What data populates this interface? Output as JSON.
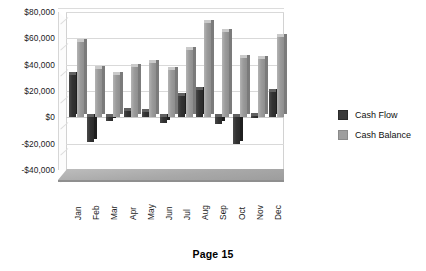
{
  "footer": {
    "page_label": "Page 15"
  },
  "legend": {
    "position": "right",
    "entries": [
      {
        "label": "Cash Flow",
        "color": "#3a3a3a"
      },
      {
        "label": "Cash Balance",
        "color": "#9e9e9e"
      }
    ]
  },
  "axes": {
    "y_ticks": [
      "$80,000",
      "$60,000",
      "$40,000",
      "$20,000",
      "$0",
      "-$20,000",
      "-$40,000"
    ],
    "y_tick_values": [
      80000,
      60000,
      40000,
      20000,
      0,
      -20000,
      -40000
    ],
    "x_ticks": [
      "Jan",
      "Feb",
      "Mar",
      "Apr",
      "May",
      "Jun",
      "Jul",
      "Aug",
      "Sep",
      "Oct",
      "Nov",
      "Dec"
    ]
  },
  "chart_data": {
    "type": "bar",
    "title": "",
    "subtitle": "",
    "xlabel": "",
    "ylabel": "",
    "ylim": [
      -40000,
      80000
    ],
    "ytick_step": 20000,
    "grid": true,
    "three_d": true,
    "legend_position": "right",
    "categories": [
      "Jan",
      "Feb",
      "Mar",
      "Apr",
      "May",
      "Jun",
      "Jul",
      "Aug",
      "Sep",
      "Oct",
      "Nov",
      "Dec"
    ],
    "series": [
      {
        "name": "Cash Flow",
        "color": "#3a3a3a",
        "values": [
          32000,
          -19000,
          -3000,
          5000,
          4000,
          -4000,
          16000,
          21000,
          -5000,
          -20000,
          1000,
          19000
        ]
      },
      {
        "name": "Cash Balance",
        "color": "#9e9e9e",
        "values": [
          57000,
          37000,
          32000,
          38000,
          41000,
          36000,
          51000,
          72000,
          65000,
          45000,
          44000,
          61000
        ]
      }
    ]
  }
}
